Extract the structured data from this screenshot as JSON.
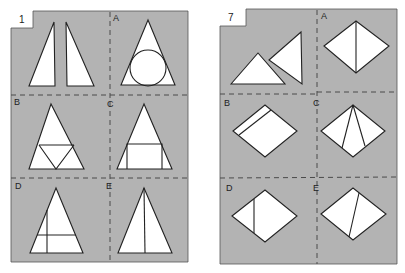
{
  "puzzles": [
    {
      "number": "1",
      "pieces_description": "two right triangles",
      "options": [
        {
          "label": "A",
          "description": "triangle with inscribed circle"
        },
        {
          "label": "B",
          "description": "triangle with midline and inverted inner triangle"
        },
        {
          "label": "C",
          "description": "triangle with rectangle at base"
        },
        {
          "label": "D",
          "description": "triangle with horizontal and vertical line"
        },
        {
          "label": "E",
          "description": "triangle split by vertical median"
        }
      ]
    },
    {
      "number": "7",
      "pieces_description": "two triangles",
      "options": [
        {
          "label": "A",
          "description": "diamond split by vertical diagonal"
        },
        {
          "label": "B",
          "description": "diamond with strip along upper-left edge"
        },
        {
          "label": "C",
          "description": "diamond with two lines from top vertex"
        },
        {
          "label": "D",
          "description": "diamond with vertical line on left"
        },
        {
          "label": "E",
          "description": "diamond with slanted line"
        }
      ]
    }
  ],
  "colors": {
    "card_background": "#b3b3b3",
    "shape_fill": "#ffffff",
    "line": "#222222"
  }
}
